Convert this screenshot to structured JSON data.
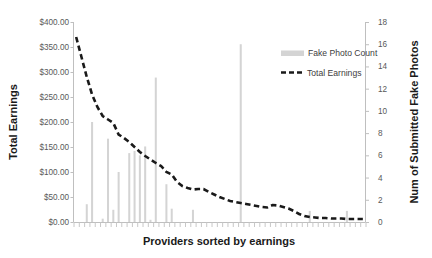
{
  "chart_data": {
    "type": "bar",
    "title": "",
    "xlabel": "Providers sorted by earnings",
    "ylabel": "Total Earnings",
    "y2label": "Num of Submitted Fake Photos",
    "grid": false,
    "legend_position": "inside-top-right",
    "ylim": [
      0,
      400
    ],
    "y2lim": [
      0,
      18
    ],
    "ytick_labels": [
      "$0.00",
      "$50.00",
      "$100.00",
      "$150.00",
      "$200.00",
      "$250.00",
      "$300.00",
      "$350.00",
      "$400.00"
    ],
    "ytick_values": [
      0,
      50,
      100,
      150,
      200,
      250,
      300,
      350,
      400
    ],
    "y2tick_labels": [
      "0",
      "2",
      "4",
      "6",
      "8",
      "10",
      "12",
      "14",
      "16",
      "18"
    ],
    "y2tick_values": [
      0,
      2,
      4,
      6,
      8,
      10,
      12,
      14,
      16,
      18
    ],
    "xtick_labels": [],
    "n_categories": 55,
    "series": [
      {
        "name": "Fake Photo Count",
        "type": "bar",
        "axis": "right",
        "color": "#d4d4d4",
        "values": [
          0,
          0,
          1.6,
          9.0,
          0,
          0.3,
          7.5,
          1.1,
          4.5,
          0,
          6.2,
          6.4,
          6.0,
          6.8,
          0.2,
          13.0,
          0,
          3.4,
          1.2,
          0,
          0,
          0,
          1.1,
          0,
          0,
          0,
          0,
          0,
          0,
          0,
          0,
          16.0,
          0,
          0,
          0,
          0,
          0,
          0,
          0,
          0,
          0,
          0,
          0,
          0,
          1.0,
          0,
          0,
          0,
          0,
          0,
          0,
          1.0,
          0,
          0,
          0
        ]
      },
      {
        "name": "Total Earnings",
        "type": "line",
        "axis": "left",
        "color": "#1a1a1a",
        "style": "dashed",
        "values": [
          370,
          330,
          290,
          255,
          230,
          212,
          205,
          198,
          175,
          168,
          160,
          150,
          140,
          132,
          125,
          118,
          112,
          100,
          95,
          80,
          72,
          68,
          65,
          66,
          66,
          60,
          55,
          50,
          46,
          42,
          40,
          38,
          36,
          34,
          32,
          30,
          29,
          34,
          33,
          30,
          27,
          22,
          16,
          12,
          10,
          9,
          8,
          8,
          7,
          7,
          7,
          6,
          6,
          6,
          6
        ]
      }
    ]
  },
  "legend": {
    "items": [
      {
        "label": "Fake Photo Count",
        "marker": "bar-swatch"
      },
      {
        "label": "Total Earnings",
        "marker": "dashed-line"
      }
    ]
  }
}
